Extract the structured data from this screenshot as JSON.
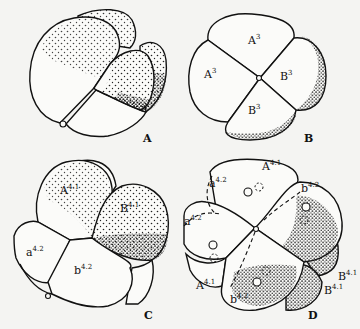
{
  "figure": {
    "panels": [
      {
        "id": "A",
        "label": "A",
        "cell_labels": []
      },
      {
        "id": "B",
        "label": "B",
        "cell_labels": [
          {
            "base": "A",
            "sup": "3",
            "pos": "top"
          },
          {
            "base": "A",
            "sup": "3",
            "pos": "left"
          },
          {
            "base": "B",
            "sup": "3",
            "pos": "right"
          },
          {
            "base": "B",
            "sup": "3",
            "pos": "bottom"
          }
        ]
      },
      {
        "id": "C",
        "label": "C",
        "cell_labels": [
          {
            "base": "A",
            "sup": "4.1"
          },
          {
            "base": "B",
            "sup": "4.1"
          },
          {
            "base": "a",
            "sup": "4.2"
          },
          {
            "base": "b",
            "sup": "4.2"
          }
        ]
      },
      {
        "id": "D",
        "label": "D",
        "cell_labels": [
          {
            "base": "A",
            "sup": "4.1",
            "pos": "top"
          },
          {
            "base": "a",
            "sup": "4.2",
            "pos": "upper-left"
          },
          {
            "base": "b",
            "sup": "4.2",
            "pos": "upper-right"
          },
          {
            "base": "a",
            "sup": "4.2",
            "pos": "left"
          },
          {
            "base": "A",
            "sup": "4.1",
            "pos": "lower-left"
          },
          {
            "base": "b",
            "sup": "4.2",
            "pos": "bottom"
          },
          {
            "base": "B",
            "sup": "4.1",
            "pos": "bottom-right"
          },
          {
            "base": "B",
            "sup": "4.1",
            "pos": "right"
          }
        ]
      }
    ]
  },
  "labels": {
    "A": "A",
    "B": "B",
    "C": "C",
    "D": "D",
    "b_top": "A",
    "b_top_sup": "3",
    "b_left": "A",
    "b_left_sup": "3",
    "b_right": "B",
    "b_right_sup": "3",
    "b_bottom": "B",
    "b_bottom_sup": "3",
    "c_A": "A",
    "c_A_sup": "4.1",
    "c_B": "B",
    "c_B_sup": "4.1",
    "c_a": "a",
    "c_a_sup": "4.2",
    "c_b": "b",
    "c_b_sup": "4.2",
    "d_top": "A",
    "d_top_sup": "4.1",
    "d_ul": "a",
    "d_ul_sup": "4.2",
    "d_ur": "b",
    "d_ur_sup": "4.2",
    "d_l": "a",
    "d_l_sup": "4.2",
    "d_ll": "A",
    "d_ll_sup": "4.1",
    "d_bot": "b",
    "d_bot_sup": "4.2",
    "d_br": "B",
    "d_br_sup": "4.1",
    "d_r": "B",
    "d_r_sup": "4.1"
  }
}
